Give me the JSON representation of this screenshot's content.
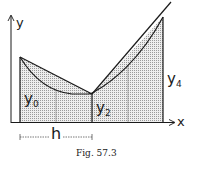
{
  "figure": {
    "caption": "Fig. 57.3",
    "axes": {
      "x_label": "x",
      "y_label": "y"
    },
    "ordinate_labels": [
      {
        "id": "y0",
        "base": "y",
        "sub": "0"
      },
      {
        "id": "y2",
        "base": "y",
        "sub": "2"
      },
      {
        "id": "y4",
        "base": "y",
        "sub": "4"
      }
    ],
    "interval_label": "h",
    "colors": {
      "stroke": "#1a1a1a",
      "shade": "#d9d9d9",
      "grid": "#8a8a8a"
    }
  }
}
